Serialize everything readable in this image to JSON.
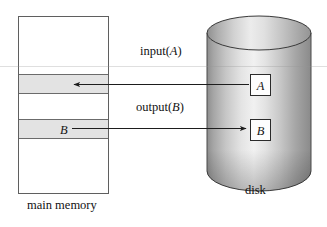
{
  "figure": {
    "type": "diagram",
    "background_color": "#ffffff",
    "width": 327,
    "height": 227
  },
  "main_memory": {
    "caption": "main memory",
    "outline_color": "#5a5a5a",
    "fill_color": "#ffffff",
    "rect": {
      "x": 18,
      "y": 16,
      "width": 91,
      "height": 178
    },
    "blocks": [
      {
        "name": "block-A-slot",
        "label": "",
        "shaded": true,
        "y": 74,
        "height": 19,
        "fill": "#e2e2e2"
      },
      {
        "name": "block-B-slot",
        "label": "B",
        "shaded": true,
        "y": 119,
        "height": 19,
        "fill": "#e2e2e2"
      }
    ],
    "dividers": [
      74,
      93,
      119,
      138
    ]
  },
  "disk": {
    "caption": "disk",
    "shape": "cylinder",
    "outline_color": "#3d3d3d",
    "gradient_light": "#f2f2f2",
    "gradient_mid": "#bdbdbd",
    "gradient_dark": "#7a7a7a",
    "cx": 259,
    "top_y": 16,
    "bottom_y": 171,
    "rx": 52,
    "ry": 17,
    "blocks": [
      {
        "name": "disk-block-A",
        "label": "A",
        "x": 250,
        "y": 74,
        "width": 20,
        "height": 21
      },
      {
        "name": "disk-block-B",
        "label": "B",
        "x": 250,
        "y": 119,
        "width": 20,
        "height": 21
      }
    ]
  },
  "operations": [
    {
      "name": "input-operation",
      "label_prefix": "input(",
      "label_arg": "A",
      "label_suffix": ")",
      "label_full": "input(A)",
      "direction": "disk-to-memory",
      "arrow_points_to": "main memory",
      "label_x": 140,
      "label_y": 52,
      "line_y": 85,
      "line_from_x": 249,
      "line_to_x": 72
    },
    {
      "name": "output-operation",
      "label_prefix": "output(",
      "label_arg": "B",
      "label_suffix": ")",
      "label_full": "output(B)",
      "direction": "memory-to-disk",
      "arrow_points_to": "disk",
      "label_x": 136,
      "label_y": 108,
      "line_y": 129,
      "line_from_x": 72,
      "line_to_x": 248
    }
  ],
  "captions": {
    "main_memory_x": 27,
    "main_memory_y": 201,
    "disk_x": 245,
    "disk_y": 186
  },
  "artifacts": {
    "scanline_y": 66,
    "scanline_color": "#969696"
  }
}
